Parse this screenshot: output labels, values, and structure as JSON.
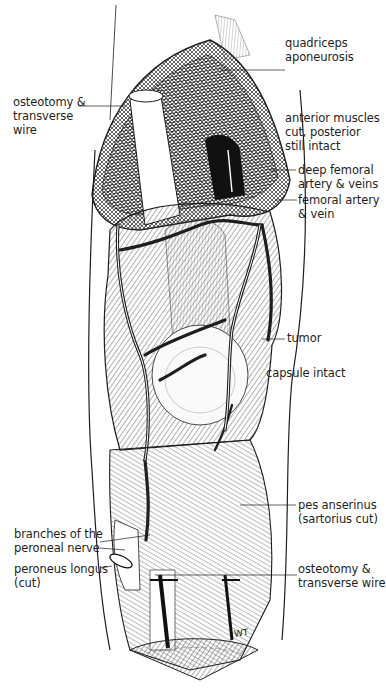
{
  "figure": {
    "colors": {
      "ink": "#1e1e1e",
      "background": "#ffffff",
      "hatch": "#3a3a3a"
    },
    "signature": "WT"
  },
  "labels": [
    {
      "id": "quadriceps-aponeurosis",
      "lines": [
        "quadriceps",
        "aponeurosis"
      ],
      "side": "right"
    },
    {
      "id": "osteotomy-transverse-wire-top",
      "lines": [
        "osteotomy &",
        "transverse",
        "wire"
      ],
      "side": "left"
    },
    {
      "id": "anterior-muscles",
      "lines": [
        "anterior muscles",
        "cut, posterior",
        "still intact"
      ],
      "side": "right"
    },
    {
      "id": "deep-femoral",
      "lines": [
        "deep femoral",
        "artery & veins"
      ],
      "side": "right"
    },
    {
      "id": "femoral-artery",
      "lines": [
        "femoral artery",
        "& vein"
      ],
      "side": "right"
    },
    {
      "id": "tumor",
      "lines": [
        "tumor"
      ],
      "side": "right"
    },
    {
      "id": "capsule-intact",
      "lines": [
        "capsule intact"
      ],
      "side": "right"
    },
    {
      "id": "pes-anserinus",
      "lines": [
        "pes anserinus",
        "(sartorius cut)"
      ],
      "side": "right"
    },
    {
      "id": "branches-peroneal-nerve",
      "lines": [
        "branches of the",
        "peroneal nerve"
      ],
      "side": "left"
    },
    {
      "id": "peroneus-longus",
      "lines": [
        "peroneus longus",
        "(cut)"
      ],
      "side": "left"
    },
    {
      "id": "osteotomy-transverse-wire-bottom",
      "lines": [
        "osteotomy &",
        "transverse wire"
      ],
      "side": "right"
    }
  ]
}
